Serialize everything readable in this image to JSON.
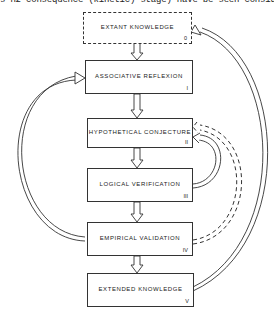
{
  "top_text": "s H2 consequence (kinetic) stage) have be seen consid",
  "diagram": {
    "boxes": [
      {
        "label": "EXTANT KNOWLEDGE",
        "number": "0"
      },
      {
        "label": "ASSOCIATIVE REFLEXION",
        "number": "I"
      },
      {
        "label": "HYPOTHETICAL CONJECTURE",
        "number": "II"
      },
      {
        "label": "LOGICAL VERIFICATION",
        "number": "III"
      },
      {
        "label": "EMPIRICAL VALIDATION",
        "number": "IV"
      },
      {
        "label": "EXTENDED KNOWLEDGE",
        "number": "V"
      }
    ],
    "arrows": [
      {
        "from": "0",
        "to": "I",
        "style": "hollow-straight"
      },
      {
        "from": "I",
        "to": "II",
        "style": "hollow-straight"
      },
      {
        "from": "II",
        "to": "III",
        "style": "hollow-straight"
      },
      {
        "from": "III",
        "to": "IV",
        "style": "hollow-straight"
      },
      {
        "from": "IV",
        "to": "V",
        "style": "hollow-straight"
      },
      {
        "from": "III",
        "to": "II",
        "style": "hollow-curved-loop"
      },
      {
        "from": "IV",
        "to": "I",
        "style": "hollow-curved-left"
      },
      {
        "from": "IV",
        "to": "II",
        "style": "dashed-curved-right"
      },
      {
        "from": "V",
        "to": "0",
        "style": "hollow-curved-right"
      }
    ]
  }
}
